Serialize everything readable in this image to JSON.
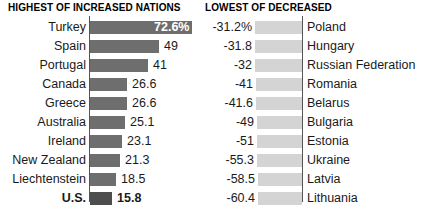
{
  "left": {
    "heading": "HIGHEST OF INCREASED NATIONS",
    "rows": [
      {
        "label": "Turkey",
        "value": "72.6%",
        "num": 72.6,
        "label_inside": true,
        "emphasis": false
      },
      {
        "label": "Spain",
        "value": "49",
        "num": 49,
        "label_inside": false,
        "emphasis": false
      },
      {
        "label": "Portugal",
        "value": "41",
        "num": 41,
        "label_inside": false,
        "emphasis": false
      },
      {
        "label": "Canada",
        "value": "26.6",
        "num": 26.6,
        "label_inside": false,
        "emphasis": false
      },
      {
        "label": "Greece",
        "value": "26.6",
        "num": 26.6,
        "label_inside": false,
        "emphasis": false
      },
      {
        "label": "Australia",
        "value": "25.1",
        "num": 25.1,
        "label_inside": false,
        "emphasis": false
      },
      {
        "label": "Ireland",
        "value": "23.1",
        "num": 23.1,
        "label_inside": false,
        "emphasis": false
      },
      {
        "label": "New Zealand",
        "value": "21.3",
        "num": 21.3,
        "label_inside": false,
        "emphasis": false
      },
      {
        "label": "Liechtenstein",
        "value": "18.5",
        "num": 18.5,
        "label_inside": false,
        "emphasis": false
      },
      {
        "label": "U.S.",
        "value": "15.8",
        "num": 15.8,
        "label_inside": false,
        "emphasis": true
      }
    ]
  },
  "right": {
    "heading": "LOWEST OF DECREASED",
    "rows": [
      {
        "value": "-31.2%",
        "num": -31.2,
        "label": "Poland"
      },
      {
        "value": "-31.8",
        "num": -31.8,
        "label": "Hungary"
      },
      {
        "value": "-32",
        "num": -32,
        "label": "Russian Federation"
      },
      {
        "value": "-41",
        "num": -41,
        "label": "Romania"
      },
      {
        "value": "-41.6",
        "num": -41.6,
        "label": "Belarus"
      },
      {
        "value": "-49",
        "num": -49,
        "label": "Bulgaria"
      },
      {
        "value": "-51",
        "num": -51,
        "label": "Estonia"
      },
      {
        "value": "-55.3",
        "num": -55.3,
        "label": "Ukraine"
      },
      {
        "value": "-58.5",
        "num": -58.5,
        "label": "Latvia"
      },
      {
        "value": "-60.4",
        "num": -60.4,
        "label": "Lithuania"
      }
    ]
  },
  "chart_data": {
    "type": "bar",
    "orientation": "horizontal",
    "panels": [
      {
        "title": "HIGHEST OF INCREASED NATIONS",
        "categories": [
          "Turkey",
          "Spain",
          "Portugal",
          "Canada",
          "Greece",
          "Australia",
          "Ireland",
          "New Zealand",
          "Liechtenstein",
          "U.S."
        ],
        "values": [
          72.6,
          49,
          41,
          26.6,
          26.6,
          25.1,
          23.1,
          21.3,
          18.5,
          15.8
        ],
        "value_labels": [
          "72.6%",
          "49",
          "41",
          "26.6",
          "26.6",
          "25.1",
          "23.1",
          "21.3",
          "18.5",
          "15.8"
        ],
        "highlighted": [
          "U.S."
        ],
        "bar_color": "#6e6e6e",
        "highlight_bar_color": "#4d4d4d",
        "xlim": [
          0,
          72.6
        ],
        "grid": false,
        "xlabel": "",
        "ylabel": ""
      },
      {
        "title": "LOWEST OF DECREASED",
        "categories": [
          "Poland",
          "Hungary",
          "Russian Federation",
          "Romania",
          "Belarus",
          "Bulgaria",
          "Estonia",
          "Ukraine",
          "Latvia",
          "Lithuania"
        ],
        "values": [
          -31.2,
          -31.8,
          -32,
          -41,
          -41.6,
          -49,
          -51,
          -55.3,
          -58.5,
          -60.4
        ],
        "value_labels": [
          "-31.2%",
          "-31.8",
          "-32",
          "-41",
          "-41.6",
          "-49",
          "-51",
          "-55.3",
          "-58.5",
          "-60.4"
        ],
        "bar_color": "#d4d4d4",
        "xlim": [
          -60.4,
          0
        ],
        "grid": false,
        "xlabel": "",
        "ylabel": ""
      }
    ]
  }
}
